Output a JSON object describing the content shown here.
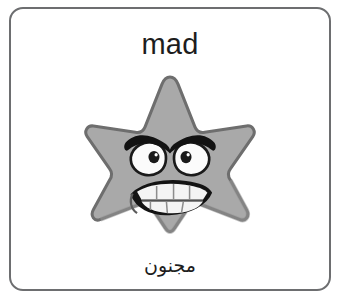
{
  "card": {
    "english_word": "mad",
    "arabic_word": "مجنون",
    "border_color": "#6d6e70",
    "background_color": "#ffffff",
    "text_color": "#1d1d1d"
  },
  "illustration": {
    "name": "angry-star-character",
    "description": "gray five-pointed cartoon star with an angry face",
    "star_fill_color": "#a9a9a9",
    "star_outline_color": "#6e6e6e",
    "star_shadow_color": "#8f8f8f",
    "eyebrow_color": "#121212",
    "eye_white_color": "#fbfbfb",
    "pupil_color": "#1a1a1a",
    "mouth_color": "#141414",
    "teeth_color": "#f4f4f4",
    "teeth_line_color": "#8d8d8d"
  }
}
